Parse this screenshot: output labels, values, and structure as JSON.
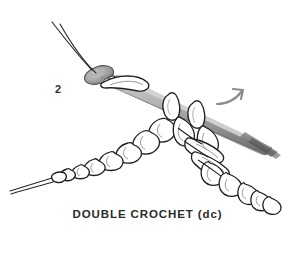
{
  "figure": {
    "background_color": "#ffffff",
    "width": 295,
    "height": 263,
    "step_number": "2",
    "caption": "DOUBLE CROCHET (dc)",
    "technique": "double crochet",
    "abbreviation": "dc"
  },
  "colors": {
    "background": "#ffffff",
    "ink_outline": "#222222",
    "yarn_outline": "#1f1f1f",
    "yarn_fill": "#ffffff",
    "hook_shaft_light": "#b9b9b9",
    "hook_shaft_mid": "#8f8f8f",
    "hook_shaft_dark": "#5e5e5e",
    "hook_head_fill": "#a5a5a5",
    "arrow": "#8a8a8a",
    "caption_text": "#2b2b2b",
    "step_text": "#333333"
  },
  "elements": {
    "crochet_hook": {
      "name": "crochet hook",
      "head_label": "hook head with throat",
      "shaft_label": "hook shaft"
    },
    "yarn_strand_top": {
      "name": "working yarn strand",
      "description": "two thin parallel yarn lines running to upper left"
    },
    "yarn_tail_left": {
      "name": "yarn tail",
      "description": "two thin parallel yarn lines running to lower left"
    },
    "chain_row": {
      "name": "foundation chain",
      "description": "row of chain stitches running to the left"
    },
    "stitch_column": {
      "name": "double crochet stitches",
      "description": "column of stitches descending to lower right"
    },
    "hook_loops": {
      "name": "loops on hook",
      "count": 2
    },
    "direction_arrow": {
      "name": "direction arrow",
      "description": "curved arrow pointing up and to the right"
    }
  }
}
